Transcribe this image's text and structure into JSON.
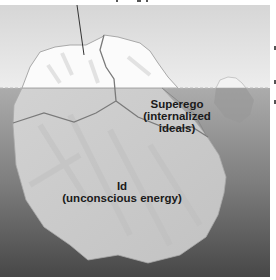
{
  "diagram": {
    "type": "iceberg-model",
    "top_label_cropped": "Ego (conscious mind...)",
    "regions": [
      {
        "id": "ego",
        "label": "",
        "position": "tip above water"
      },
      {
        "id": "superego",
        "title": "Superego",
        "subtitle": "(internalized",
        "subtitle2": "ideals)"
      },
      {
        "id": "id",
        "title": "Id",
        "subtitle": "(unconscious energy)"
      }
    ],
    "colors": {
      "sky_top": "#d9d9d9",
      "sky_bottom": "#ececec",
      "water_top": "#a8a8a8",
      "water_bottom": "#4a4a4a",
      "ice_above": "#fafafa",
      "ice_below": "#cdcdcd",
      "boundary_line": "#7a7a7a"
    }
  }
}
